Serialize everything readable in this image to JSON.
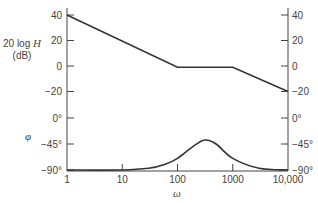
{
  "chart_data": [
    {
      "type": "line",
      "title": "",
      "panel": "magnitude",
      "xlabel": "ω",
      "ylabel": "20 log H (dB)",
      "ylabel_line1": "20 log ",
      "ylabel_var": "H",
      "ylabel_line2": "(dB)",
      "xscale": "log",
      "xlim": [
        1,
        10000
      ],
      "ylim": [
        -20,
        40
      ],
      "yticks": [
        40,
        20,
        0,
        -20
      ],
      "ytick_labels": [
        "40",
        "20",
        "0",
        "-20"
      ],
      "right_ytick_labels": [
        "40",
        "20",
        "0",
        "-20"
      ],
      "grid": false,
      "series": [
        {
          "name": "magnitude asymptote",
          "x": [
            1,
            100,
            1000,
            10000
          ],
          "y": [
            40,
            -1,
            -1,
            -20
          ]
        }
      ]
    },
    {
      "type": "line",
      "title": "",
      "panel": "phase",
      "xlabel": "ω",
      "ylabel": "φ",
      "xscale": "log",
      "xlim": [
        1,
        10000
      ],
      "ylim": [
        -90,
        0
      ],
      "yticks": [
        0,
        -45,
        -90
      ],
      "ytick_labels": [
        "0°",
        "−45°",
        "−90°"
      ],
      "right_ytick_labels": [
        "0°",
        "−45°",
        "−90°"
      ],
      "xticks": [
        1,
        10,
        100,
        1000,
        10000
      ],
      "xtick_labels": [
        "1",
        "10",
        "100",
        "1000",
        "10,000"
      ],
      "grid": false,
      "series": [
        {
          "name": "phase",
          "x": [
            1,
            10,
            30,
            60,
            100,
            200,
            316,
            500,
            1000,
            3000,
            10000
          ],
          "y": [
            -90,
            -90,
            -87,
            -80,
            -70,
            -48,
            -38,
            -45,
            -70,
            -87,
            -90
          ]
        }
      ]
    }
  ]
}
